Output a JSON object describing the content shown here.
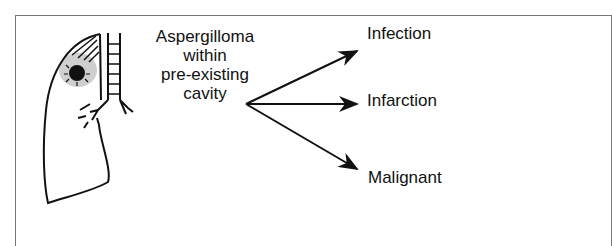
{
  "diagram": {
    "source_label_lines": [
      "Aspergilloma",
      "within",
      "pre-existing",
      "cavity"
    ],
    "outcomes": [
      {
        "label": "Infection"
      },
      {
        "label": "Infarction"
      },
      {
        "label": "Malignant"
      }
    ],
    "illustration": "lung-with-aspergilloma-icon",
    "colors": {
      "line": "#111111",
      "shading": "#cfcfcf",
      "border": "#777777"
    }
  }
}
